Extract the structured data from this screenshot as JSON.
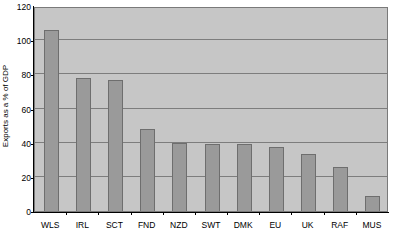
{
  "chart_data": {
    "type": "bar",
    "title": "",
    "subtitle": "",
    "xlabel": "",
    "ylabel": "Exports as a % of GDP",
    "ylim": [
      0,
      120
    ],
    "ytick_labels": [
      "120",
      "100",
      "80",
      "60",
      "40",
      "20",
      "0"
    ],
    "ytick_values": [
      120,
      100,
      80,
      60,
      40,
      20,
      0
    ],
    "ytick_interval": 20,
    "grid": "horizontal",
    "gridlines_at": [
      100,
      80,
      60,
      40,
      20
    ],
    "legend": null,
    "legend_position": "none",
    "categories": [
      "WLS",
      "IRL",
      "SCT",
      "FND",
      "NZD",
      "SWT",
      "DMK",
      "EU",
      "UK",
      "RAF",
      "MUS"
    ],
    "values": [
      106,
      78,
      76.5,
      48,
      40,
      39.5,
      39.5,
      37.5,
      33.5,
      26,
      8.5
    ],
    "series": [
      {
        "name": "Exports as a % of GDP",
        "values": [
          106,
          78,
          76.5,
          48,
          40,
          39.5,
          39.5,
          37.5,
          33.5,
          26,
          8.5
        ]
      }
    ],
    "annotations": [],
    "colors": {
      "bar_fill": "#9a9a9a",
      "bar_edge": "#6e6e6e",
      "plot_background": "#c6c6c6",
      "gridline": "#7d7d7d",
      "axis": "#000000",
      "figure_background": "#ffffff"
    }
  },
  "axis": {
    "y_title": "Exports as a % of GDP",
    "y_ticks": [
      "120",
      "100",
      "80",
      "60",
      "40",
      "20",
      "0"
    ],
    "x_ticks": [
      "WLS",
      "IRL",
      "SCT",
      "FND",
      "NZD",
      "SWT",
      "DMK",
      "EU",
      "UK",
      "RAF",
      "MUS"
    ]
  },
  "caption": {
    "fragment_left": "",
    "fragment_right": ""
  }
}
